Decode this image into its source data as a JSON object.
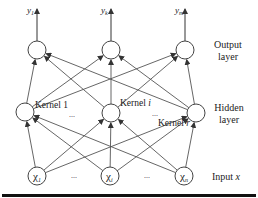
{
  "diagram": {
    "type": "neural-network",
    "layers": {
      "output": {
        "label": "Output layer",
        "label_lines": [
          "Output",
          "layer"
        ],
        "nodes": [
          {
            "id": "y1",
            "label": "y",
            "sub": "1",
            "x": 37,
            "y": 50
          },
          {
            "id": "yk",
            "label": "y",
            "sub": "k",
            "x": 111,
            "y": 50
          },
          {
            "id": "ym",
            "label": "y",
            "sub": "m",
            "x": 185,
            "y": 50
          }
        ]
      },
      "hidden": {
        "label": "Hidden layer",
        "label_lines": [
          "Hidden",
          "layer"
        ],
        "nodes": [
          {
            "id": "k1",
            "label": "Kernel 1",
            "x": 25,
            "y": 112
          },
          {
            "id": "ki",
            "label": "Kernel i",
            "x": 111,
            "y": 113
          },
          {
            "id": "kr",
            "label": "Kernel r",
            "x": 196,
            "y": 113
          }
        ]
      },
      "input": {
        "label": "Input x",
        "label_lines": [
          "Input ",
          "x"
        ],
        "nodes": [
          {
            "id": "x1",
            "label": "χ",
            "sub": "1",
            "x": 37,
            "y": 176
          },
          {
            "id": "xi",
            "label": "χ",
            "sub": "i",
            "x": 110,
            "y": 176
          },
          {
            "id": "xn",
            "label": "χ",
            "sub": "n",
            "x": 184,
            "y": 176
          }
        ]
      }
    },
    "ellipsis": "...",
    "connections": "fully-connected input→hidden, hidden→output; each output node emits an arrow upward",
    "colors": {
      "line": "#555555",
      "node_stroke": "#444444",
      "text": "#222222",
      "bottom_rule": "#111111"
    }
  }
}
